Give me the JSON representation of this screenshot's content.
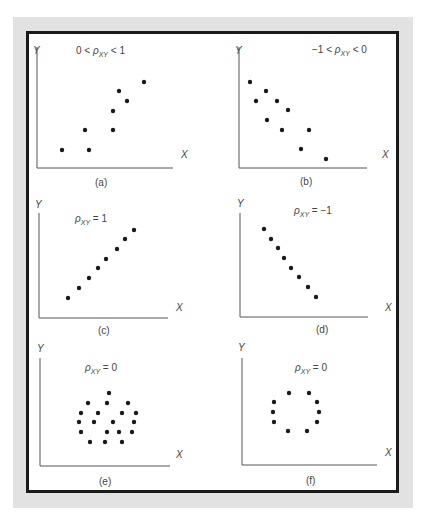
{
  "figure": {
    "frame_color": "#e2e2e2",
    "border_color": "#1a1a1a",
    "dot_color": "#1a1a1a",
    "panels": [
      {
        "id": "a",
        "caption": "(a)",
        "title": {
          "pre": "0 < ",
          "rho": "ρ",
          "sub": "XY",
          "post": " < 1"
        },
        "x_label": "X",
        "y_label": "Y"
      },
      {
        "id": "b",
        "caption": "(b)",
        "title": {
          "pre": "−1 < ",
          "rho": "ρ",
          "sub": "XY",
          "post": " < 0"
        },
        "x_label": "X",
        "y_label": "Y"
      },
      {
        "id": "c",
        "caption": "(c)",
        "title": {
          "pre": "",
          "rho": "ρ",
          "sub": "XY",
          "post": " = 1"
        },
        "x_label": "X",
        "y_label": "Y"
      },
      {
        "id": "d",
        "caption": "(d)",
        "title": {
          "pre": "",
          "rho": "ρ",
          "sub": "XY",
          "post": " = −1"
        },
        "x_label": "X",
        "y_label": "Y"
      },
      {
        "id": "e",
        "caption": "(e)",
        "title": {
          "pre": "",
          "rho": "ρ",
          "sub": "XY",
          "post": " = 0"
        },
        "x_label": "X",
        "y_label": "Y"
      },
      {
        "id": "f",
        "caption": "(f)",
        "title": {
          "pre": "",
          "rho": "ρ",
          "sub": "XY",
          "post": " = 0"
        },
        "x_label": "X",
        "y_label": "Y"
      }
    ]
  },
  "chart_data": [
    {
      "type": "scatter",
      "title": "0 < ρXY < 1",
      "caption": "(a)",
      "xlabel": "X",
      "ylabel": "Y",
      "points_px": [
        [
          62,
          150
        ],
        [
          89,
          150
        ],
        [
          85,
          130
        ],
        [
          113,
          130
        ],
        [
          113,
          111
        ],
        [
          119,
          91
        ],
        [
          127,
          101
        ],
        [
          144,
          82
        ]
      ]
    },
    {
      "type": "scatter",
      "title": "−1 < ρXY < 0",
      "caption": "(b)",
      "xlabel": "X",
      "ylabel": "Y",
      "points_px": [
        [
          250,
          82
        ],
        [
          266,
          91
        ],
        [
          256,
          101
        ],
        [
          277,
          101
        ],
        [
          288,
          110
        ],
        [
          267,
          120
        ],
        [
          282,
          130
        ],
        [
          309,
          130
        ],
        [
          301,
          149
        ],
        [
          326,
          159
        ]
      ]
    },
    {
      "type": "scatter",
      "title": "ρXY = 1",
      "caption": "(c)",
      "xlabel": "X",
      "ylabel": "Y",
      "points_px": [
        [
          68,
          298
        ],
        [
          79,
          288
        ],
        [
          89,
          278
        ],
        [
          98,
          268
        ],
        [
          106,
          259
        ],
        [
          117,
          249
        ],
        [
          125,
          239
        ],
        [
          134,
          230
        ]
      ]
    },
    {
      "type": "scatter",
      "title": "ρXY = −1",
      "caption": "(d)",
      "xlabel": "X",
      "ylabel": "Y",
      "points_px": [
        [
          264,
          229
        ],
        [
          271,
          239
        ],
        [
          278,
          248
        ],
        [
          284,
          258
        ],
        [
          291,
          268
        ],
        [
          299,
          277
        ],
        [
          308,
          287
        ],
        [
          316,
          297
        ]
      ]
    },
    {
      "type": "scatter",
      "title": "ρXY = 0",
      "caption": "(e)",
      "xlabel": "X",
      "ylabel": "Y",
      "points_px": [
        [
          109,
          393
        ],
        [
          88,
          403
        ],
        [
          107,
          403
        ],
        [
          128,
          403
        ],
        [
          81,
          413
        ],
        [
          98,
          413
        ],
        [
          122,
          413
        ],
        [
          136,
          413
        ],
        [
          79,
          422
        ],
        [
          94,
          422
        ],
        [
          113,
          422
        ],
        [
          134,
          422
        ],
        [
          81,
          432
        ],
        [
          107,
          432
        ],
        [
          119,
          432
        ],
        [
          132,
          432
        ],
        [
          90,
          442
        ],
        [
          105,
          442
        ],
        [
          122,
          442
        ]
      ]
    },
    {
      "type": "scatter",
      "title": "ρXY = 0",
      "caption": "(f)",
      "xlabel": "X",
      "ylabel": "Y",
      "points_px": [
        [
          289,
          393
        ],
        [
          309,
          393
        ],
        [
          274,
          402
        ],
        [
          317,
          402
        ],
        [
          273,
          412
        ],
        [
          319,
          412
        ],
        [
          274,
          422
        ],
        [
          317,
          422
        ],
        [
          288,
          431
        ],
        [
          307,
          431
        ]
      ]
    }
  ]
}
